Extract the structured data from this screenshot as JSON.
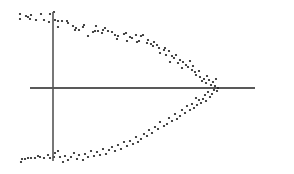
{
  "chart_data": {
    "type": "scatter",
    "title": "",
    "xlabel": "",
    "ylabel": "",
    "legend": [],
    "grid": false,
    "tick_labels": {
      "x": [],
      "y": []
    },
    "coordinate_space": "pixel",
    "axes": {
      "horizontal": {
        "x1": 30,
        "x2": 255,
        "y": 88,
        "color": "#222222",
        "width": 1.3
      },
      "vertical": {
        "x": 53,
        "y1": 12,
        "y2": 161,
        "color": "#555555",
        "width": 1.6
      }
    },
    "point_color": "#1a1a1a",
    "point_radius": 1.1,
    "points": [
      [
        20,
        14
      ],
      [
        20,
        19
      ],
      [
        26,
        16
      ],
      [
        28,
        17
      ],
      [
        30,
        19
      ],
      [
        31,
        15
      ],
      [
        36,
        20
      ],
      [
        41,
        14
      ],
      [
        44,
        20
      ],
      [
        49,
        22
      ],
      [
        50,
        14
      ],
      [
        54,
        12
      ],
      [
        55,
        20
      ],
      [
        58,
        21
      ],
      [
        58,
        27
      ],
      [
        62,
        21
      ],
      [
        67,
        21
      ],
      [
        68,
        23
      ],
      [
        73,
        26
      ],
      [
        75,
        30
      ],
      [
        76,
        28
      ],
      [
        79,
        30
      ],
      [
        83,
        27
      ],
      [
        84,
        25
      ],
      [
        88,
        36
      ],
      [
        93,
        32
      ],
      [
        95,
        31
      ],
      [
        96,
        26
      ],
      [
        98,
        31
      ],
      [
        102,
        33
      ],
      [
        103,
        30
      ],
      [
        105,
        28
      ],
      [
        108,
        31
      ],
      [
        112,
        32
      ],
      [
        115,
        35
      ],
      [
        117,
        39
      ],
      [
        118,
        36
      ],
      [
        124,
        34
      ],
      [
        126,
        33
      ],
      [
        127,
        41
      ],
      [
        130,
        37
      ],
      [
        132,
        38
      ],
      [
        136,
        35
      ],
      [
        137,
        42
      ],
      [
        139,
        41
      ],
      [
        141,
        36
      ],
      [
        143,
        35
      ],
      [
        147,
        43
      ],
      [
        148,
        40
      ],
      [
        151,
        44
      ],
      [
        153,
        46
      ],
      [
        154,
        42
      ],
      [
        157,
        45
      ],
      [
        159,
        48
      ],
      [
        160,
        53
      ],
      [
        164,
        50
      ],
      [
        165,
        48
      ],
      [
        166,
        55
      ],
      [
        169,
        51
      ],
      [
        172,
        56
      ],
      [
        170,
        62
      ],
      [
        174,
        58
      ],
      [
        176,
        55
      ],
      [
        178,
        63
      ],
      [
        180,
        60
      ],
      [
        182,
        68
      ],
      [
        183,
        62
      ],
      [
        186,
        65
      ],
      [
        188,
        67
      ],
      [
        190,
        61
      ],
      [
        192,
        70
      ],
      [
        193,
        66
      ],
      [
        195,
        72
      ],
      [
        196,
        75
      ],
      [
        199,
        71
      ],
      [
        200,
        77
      ],
      [
        202,
        81
      ],
      [
        204,
        79
      ],
      [
        206,
        83
      ],
      [
        207,
        76
      ],
      [
        209,
        80
      ],
      [
        211,
        85
      ],
      [
        213,
        82
      ],
      [
        215,
        86
      ],
      [
        216,
        79
      ],
      [
        218,
        88
      ],
      [
        217,
        91
      ],
      [
        214,
        90
      ],
      [
        212,
        94
      ],
      [
        210,
        97
      ],
      [
        208,
        92
      ],
      [
        205,
        95
      ],
      [
        203,
        99
      ],
      [
        206,
        101
      ],
      [
        201,
        103
      ],
      [
        199,
        100
      ],
      [
        196,
        98
      ],
      [
        197,
        105
      ],
      [
        194,
        108
      ],
      [
        192,
        104
      ],
      [
        190,
        110
      ],
      [
        187,
        106
      ],
      [
        185,
        113
      ],
      [
        182,
        110
      ],
      [
        180,
        116
      ],
      [
        177,
        119
      ],
      [
        175,
        114
      ],
      [
        172,
        121
      ],
      [
        169,
        118
      ],
      [
        167,
        124
      ],
      [
        164,
        126
      ],
      [
        160,
        122
      ],
      [
        158,
        129
      ],
      [
        155,
        127
      ],
      [
        152,
        133
      ],
      [
        149,
        130
      ],
      [
        147,
        136
      ],
      [
        144,
        134
      ],
      [
        141,
        139
      ],
      [
        138,
        142
      ],
      [
        136,
        137
      ],
      [
        133,
        144
      ],
      [
        130,
        141
      ],
      [
        127,
        146
      ],
      [
        124,
        142
      ],
      [
        121,
        149
      ],
      [
        118,
        145
      ],
      [
        115,
        151
      ],
      [
        112,
        147
      ],
      [
        109,
        150
      ],
      [
        106,
        154
      ],
      [
        103,
        149
      ],
      [
        100,
        155
      ],
      [
        97,
        152
      ],
      [
        94,
        156
      ],
      [
        91,
        151
      ],
      [
        88,
        157
      ],
      [
        85,
        154
      ],
      [
        83,
        160
      ],
      [
        79,
        155
      ],
      [
        77,
        159
      ],
      [
        74,
        153
      ],
      [
        71,
        157
      ],
      [
        68,
        160
      ],
      [
        65,
        156
      ],
      [
        63,
        162
      ],
      [
        60,
        157
      ],
      [
        58,
        151
      ],
      [
        55,
        153
      ],
      [
        54,
        157
      ],
      [
        50,
        158
      ],
      [
        48,
        155
      ],
      [
        44,
        158
      ],
      [
        40,
        157
      ],
      [
        38,
        156
      ],
      [
        35,
        158
      ],
      [
        31,
        158
      ],
      [
        28,
        158
      ],
      [
        25,
        159
      ],
      [
        22,
        159
      ],
      [
        21,
        162
      ]
    ]
  }
}
